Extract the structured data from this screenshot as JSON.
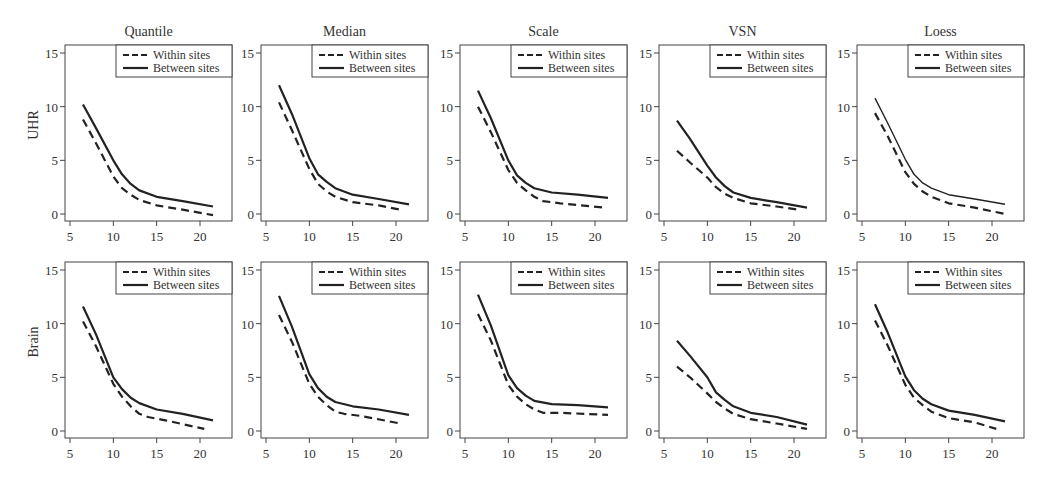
{
  "chart_data": {
    "type": "line",
    "layout": "2x5 small multiples",
    "columns": [
      "Quantile",
      "Median",
      "Scale",
      "VSN",
      "Loess"
    ],
    "rows": [
      "UHR",
      "Brain"
    ],
    "xticks": [
      5,
      10,
      15,
      20
    ],
    "yticks": [
      0,
      5,
      10,
      15
    ],
    "xlim": [
      4.5,
      24
    ],
    "ylim": [
      -0.6,
      16.3
    ],
    "grid": false,
    "legend": {
      "position": "top-right",
      "entries": [
        {
          "label": "Within sites",
          "style": "dashed"
        },
        {
          "label": "Between sites",
          "style": "solid"
        }
      ]
    },
    "x": [
      6.5,
      8,
      10,
      11,
      12,
      13,
      15,
      18,
      21.5
    ],
    "panels": [
      {
        "row": "UHR",
        "column": "Quantile",
        "series": [
          {
            "name": "Within sites",
            "x": [
              6.5,
              8,
              10,
              11,
              12,
              13,
              15,
              18,
              21.5
            ],
            "values": [
              8.8,
              6.6,
              3.5,
              2.4,
              1.8,
              1.3,
              0.8,
              0.4,
              -0.1
            ]
          },
          {
            "name": "Between sites",
            "x": [
              6.5,
              8,
              10,
              11,
              12,
              13,
              15,
              18,
              21.5
            ],
            "values": [
              10.2,
              8.0,
              5.0,
              3.7,
              2.8,
              2.2,
              1.6,
              1.2,
              0.7
            ]
          }
        ]
      },
      {
        "row": "UHR",
        "column": "Median",
        "series": [
          {
            "name": "Within sites",
            "x": [
              6.5,
              8,
              10,
              11,
              12,
              13,
              15,
              18,
              20.5
            ],
            "values": [
              10.4,
              7.8,
              4.2,
              2.8,
              2.1,
              1.6,
              1.1,
              0.8,
              0.4
            ]
          },
          {
            "name": "Between sites",
            "x": [
              6.5,
              8,
              10,
              11,
              12,
              13,
              15,
              18,
              21.5
            ],
            "values": [
              12.0,
              9.3,
              5.2,
              3.7,
              3.0,
              2.4,
              1.8,
              1.4,
              0.9
            ]
          }
        ]
      },
      {
        "row": "UHR",
        "column": "Scale",
        "series": [
          {
            "name": "Within sites",
            "x": [
              6.5,
              8,
              10,
              11,
              12,
              13,
              14,
              16,
              21
            ],
            "values": [
              10.0,
              7.6,
              4.1,
              2.9,
              2.2,
              1.6,
              1.2,
              1.0,
              0.6
            ]
          },
          {
            "name": "Between sites",
            "x": [
              6.5,
              8,
              10,
              11,
              12,
              13,
              15,
              18,
              21.5
            ],
            "values": [
              11.5,
              8.9,
              5.0,
              3.6,
              2.9,
              2.4,
              2.0,
              1.8,
              1.5
            ]
          }
        ]
      },
      {
        "row": "UHR",
        "column": "VSN",
        "series": [
          {
            "name": "Within sites",
            "x": [
              6.5,
              8,
              10,
              11,
              12,
              13,
              15,
              18,
              20.5
            ],
            "values": [
              5.9,
              4.8,
              3.4,
              2.5,
              1.9,
              1.5,
              1.0,
              0.7,
              0.4
            ]
          },
          {
            "name": "Between sites",
            "x": [
              6.5,
              8,
              10,
              11,
              12,
              13,
              15,
              18,
              21.5
            ],
            "values": [
              8.7,
              7.0,
              4.5,
              3.4,
              2.6,
              2.0,
              1.5,
              1.1,
              0.6
            ]
          }
        ]
      },
      {
        "row": "UHR",
        "column": "Loess",
        "series": [
          {
            "name": "Within sites",
            "x": [
              6.5,
              8,
              10,
              11,
              12,
              13,
              15,
              18,
              21.5
            ],
            "values": [
              9.4,
              7.2,
              3.9,
              2.8,
              2.1,
              1.6,
              1.0,
              0.6,
              0.0
            ]
          },
          {
            "name": "Between sites",
            "x": [
              6.5,
              8,
              10,
              11,
              12,
              13,
              15,
              18,
              21.5
            ],
            "values": [
              10.8,
              8.4,
              5.1,
              3.7,
              2.9,
              2.4,
              1.8,
              1.4,
              0.9
            ]
          }
        ]
      },
      {
        "row": "Brain",
        "column": "Quantile",
        "series": [
          {
            "name": "Within sites",
            "x": [
              6.5,
              8,
              10,
              11,
              12,
              13,
              14,
              16,
              20.5
            ],
            "values": [
              10.2,
              7.9,
              4.4,
              3.2,
              2.3,
              1.6,
              1.3,
              1.0,
              0.2
            ]
          },
          {
            "name": "Between sites",
            "x": [
              6.5,
              8,
              10,
              11,
              12,
              13,
              15,
              18,
              21.5
            ],
            "values": [
              11.6,
              9.0,
              5.0,
              3.9,
              3.1,
              2.6,
              2.0,
              1.6,
              1.0
            ]
          }
        ]
      },
      {
        "row": "Brain",
        "column": "Median",
        "series": [
          {
            "name": "Within sites",
            "x": [
              6.5,
              8,
              10,
              11,
              12,
              13,
              14,
              16,
              20.5
            ],
            "values": [
              10.8,
              8.3,
              4.4,
              3.2,
              2.4,
              1.8,
              1.6,
              1.4,
              0.7
            ]
          },
          {
            "name": "Between sites",
            "x": [
              6.5,
              8,
              10,
              11,
              12,
              13,
              15,
              18,
              21.5
            ],
            "values": [
              12.6,
              9.7,
              5.3,
              4.0,
              3.2,
              2.7,
              2.3,
              2.0,
              1.5
            ]
          }
        ]
      },
      {
        "row": "Brain",
        "column": "Scale",
        "series": [
          {
            "name": "Within sites",
            "x": [
              6.5,
              8,
              10,
              11,
              12,
              13,
              14,
              16,
              21.5
            ],
            "values": [
              10.9,
              8.4,
              4.3,
              3.2,
              2.5,
              2.0,
              1.7,
              1.7,
              1.5
            ]
          },
          {
            "name": "Between sites",
            "x": [
              6.5,
              8,
              10,
              11,
              12,
              13,
              15,
              18,
              21.5
            ],
            "values": [
              12.7,
              9.8,
              5.2,
              4.0,
              3.3,
              2.8,
              2.5,
              2.4,
              2.2
            ]
          }
        ]
      },
      {
        "row": "Brain",
        "column": "VSN",
        "series": [
          {
            "name": "Within sites",
            "x": [
              6.5,
              8,
              10,
              11,
              12,
              13,
              15,
              18,
              21.5
            ],
            "values": [
              6.0,
              5.0,
              3.5,
              2.7,
              2.1,
              1.6,
              1.1,
              0.7,
              0.2
            ]
          },
          {
            "name": "Between sites",
            "x": [
              6.5,
              8,
              10,
              11,
              12,
              13,
              15,
              18,
              21.5
            ],
            "values": [
              8.4,
              7.0,
              5.0,
              3.6,
              2.9,
              2.3,
              1.7,
              1.3,
              0.6
            ]
          }
        ]
      },
      {
        "row": "Brain",
        "column": "Loess",
        "series": [
          {
            "name": "Within sites",
            "x": [
              6.5,
              8,
              10,
              11,
              12,
              13,
              15,
              18,
              20.5
            ],
            "values": [
              10.3,
              7.9,
              4.3,
              3.1,
              2.4,
              1.8,
              1.2,
              0.8,
              0.2
            ]
          },
          {
            "name": "Between sites",
            "x": [
              6.5,
              8,
              10,
              11,
              12,
              13,
              15,
              18,
              21.5
            ],
            "values": [
              11.8,
              9.1,
              5.1,
              3.8,
              3.0,
              2.5,
              1.9,
              1.5,
              0.9
            ]
          }
        ]
      }
    ]
  },
  "style": {
    "line_color": "#222222",
    "axis_color": "#444444",
    "text_color": "#333333"
  }
}
